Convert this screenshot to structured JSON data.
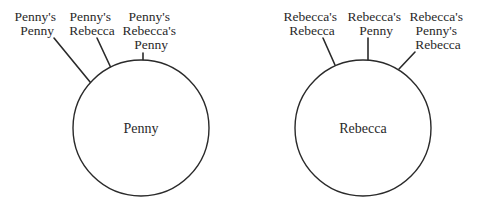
{
  "diagram": {
    "nodes": [
      {
        "id": "penny",
        "label": "Penny",
        "cx": 141,
        "cy": 128,
        "r": 68,
        "perspectives": [
          {
            "lines": [
              "Penny's",
              "Penny"
            ],
            "x": 37,
            "y": 20,
            "line": [
              54,
              38,
              95,
              88
            ]
          },
          {
            "lines": [
              "Penny's",
              "Rebecca"
            ],
            "x": 92,
            "y": 20,
            "line": [
              97,
              38,
              111,
              68
            ]
          },
          {
            "lines": [
              "Penny's",
              "Rebecca's",
              "Penny"
            ],
            "x": 151,
            "y": 20,
            "line": [
              143,
              53,
              143,
              61
            ]
          }
        ]
      },
      {
        "id": "rebecca",
        "label": "Rebecca",
        "cx": 363,
        "cy": 128,
        "r": 68,
        "perspectives": [
          {
            "lines": [
              "Rebecca's",
              "Rebecca"
            ],
            "x": 312,
            "y": 20,
            "line": [
              323,
              38,
              335,
              65
            ]
          },
          {
            "lines": [
              "Rebecca's",
              "Penny"
            ],
            "x": 376,
            "y": 20,
            "line": [
              368,
              38,
              368,
              60
            ]
          },
          {
            "lines": [
              "Rebecca's",
              "Penny's",
              "Rebecca"
            ],
            "x": 438,
            "y": 20,
            "line": [
              415,
              52,
              399,
              69
            ]
          }
        ]
      }
    ]
  }
}
